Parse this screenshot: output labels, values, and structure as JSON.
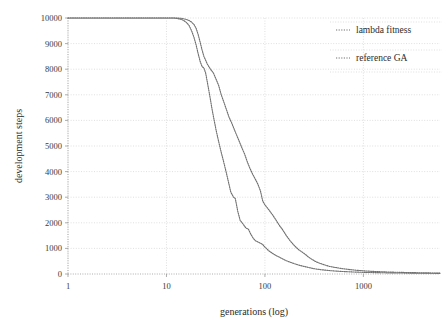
{
  "chart_data": {
    "type": "line",
    "title": "",
    "xlabel": "generations (log)",
    "ylabel": "development steps",
    "xscale": "log",
    "xlim": [
      1,
      6000
    ],
    "ylim": [
      0,
      10000
    ],
    "xticks": [
      1,
      10,
      100,
      1000
    ],
    "xtick_labels": [
      "1",
      "10",
      "100",
      "1000"
    ],
    "yticks": [
      0,
      1000,
      2000,
      3000,
      4000,
      5000,
      6000,
      7000,
      8000,
      9000,
      10000
    ],
    "ytick_labels": [
      "0",
      "1000",
      "2000",
      "3000",
      "4000",
      "5000",
      "6000",
      "7000",
      "8000",
      "9000",
      "10000"
    ],
    "grid": true,
    "legend_position": "top-right",
    "line_style": "dotted",
    "series": [
      {
        "name": "lambda fitness",
        "color": "#707070",
        "x": [
          1,
          2,
          3,
          4,
          5,
          6,
          7,
          8,
          9,
          10,
          11,
          12,
          13,
          14,
          15,
          16,
          17,
          18,
          19,
          20,
          21,
          22,
          23,
          24,
          25,
          26,
          27,
          28,
          29,
          30,
          32,
          34,
          36,
          38,
          40,
          42,
          45,
          48,
          50,
          53,
          56,
          60,
          64,
          68,
          72,
          76,
          80,
          85,
          90,
          95,
          100,
          110,
          120,
          130,
          140,
          150,
          165,
          180,
          200,
          220,
          240,
          260,
          280,
          300,
          330,
          360,
          400,
          450,
          500,
          600,
          700,
          800,
          1000,
          1200,
          1500,
          2000,
          2500,
          3000,
          4000,
          5000,
          6000
        ],
        "y": [
          10000,
          10000,
          10000,
          10000,
          10000,
          10000,
          10000,
          10000,
          10000,
          10000,
          10000,
          10000,
          9980,
          9950,
          9900,
          9820,
          9700,
          9500,
          9250,
          8950,
          8600,
          8300,
          8100,
          8050,
          7850,
          7500,
          7150,
          6800,
          6450,
          6150,
          5600,
          5150,
          4750,
          4400,
          4050,
          3700,
          3200,
          3000,
          2950,
          2450,
          2100,
          1950,
          1800,
          1750,
          1550,
          1400,
          1300,
          1250,
          1200,
          1150,
          1050,
          900,
          800,
          720,
          660,
          600,
          520,
          460,
          400,
          350,
          310,
          280,
          250,
          225,
          195,
          175,
          155,
          135,
          120,
          100,
          88,
          78,
          65,
          58,
          50,
          42,
          38,
          34,
          30,
          28,
          26
        ]
      },
      {
        "name": "reference GA",
        "color": "#707070",
        "x": [
          1,
          2,
          3,
          4,
          5,
          6,
          7,
          8,
          9,
          10,
          11,
          12,
          13,
          14,
          15,
          16,
          17,
          18,
          19,
          20,
          21,
          22,
          23,
          24,
          25,
          26,
          28,
          30,
          32,
          34,
          36,
          38,
          40,
          43,
          46,
          50,
          54,
          58,
          62,
          66,
          70,
          75,
          80,
          85,
          90,
          95,
          100,
          110,
          120,
          130,
          140,
          150,
          165,
          180,
          200,
          220,
          240,
          260,
          280,
          300,
          330,
          360,
          400,
          450,
          500,
          600,
          700,
          800,
          1000,
          1200,
          1500,
          2000,
          2500,
          3000,
          4000,
          5000,
          6000
        ],
        "y": [
          10000,
          10000,
          10000,
          10000,
          10000,
          10000,
          10000,
          10000,
          10000,
          10000,
          10000,
          10000,
          10000,
          9990,
          9970,
          9940,
          9900,
          9840,
          9750,
          9600,
          9350,
          9050,
          8750,
          8500,
          8350,
          8200,
          8000,
          7850,
          7600,
          7350,
          7000,
          6750,
          6500,
          6150,
          5900,
          5550,
          5250,
          4950,
          4700,
          4400,
          4150,
          3900,
          3700,
          3500,
          3250,
          2850,
          2700,
          2500,
          2300,
          2100,
          1900,
          1750,
          1500,
          1300,
          1100,
          950,
          850,
          750,
          650,
          570,
          480,
          420,
          360,
          300,
          265,
          215,
          180,
          155,
          125,
          105,
          88,
          72,
          62,
          55,
          46,
          40,
          36
        ]
      }
    ]
  },
  "legend": {
    "entries": [
      {
        "label": "lambda fitness"
      },
      {
        "label": "reference GA"
      }
    ]
  }
}
